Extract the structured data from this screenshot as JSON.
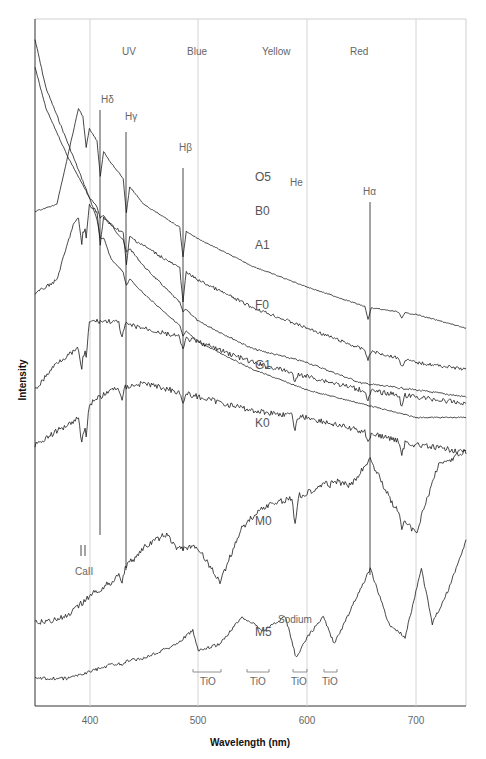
{
  "chart_data": {
    "type": "line",
    "title": "",
    "xlabel": "Wavelength (nm)",
    "ylabel": "Intensity",
    "xlim": [
      350,
      746
    ],
    "ylim": [
      0,
      1
    ],
    "grid": true,
    "x_ticks": [
      400,
      500,
      600,
      700
    ],
    "x_tick_labels": [
      "400",
      "500",
      "600",
      "700"
    ],
    "bands": [
      {
        "label": "UV",
        "x": 436
      },
      {
        "label": "Blue",
        "x": 530
      },
      {
        "label": "Yellow",
        "x": 630
      },
      {
        "label": "Red",
        "x": 736
      }
    ],
    "series": [
      {
        "name": "O5",
        "x": [
          350,
          360,
          380,
          400,
          420,
          450,
          500,
          550,
          600,
          650,
          700,
          746
        ],
        "values": [
          0.97,
          0.9,
          0.82,
          0.74,
          0.7,
          0.64,
          0.56,
          0.52,
          0.5,
          0.47,
          0.46,
          0.45
        ]
      },
      {
        "name": "B0",
        "x": [
          350,
          360,
          380,
          400,
          420,
          450,
          500,
          550,
          600,
          650,
          700,
          746
        ],
        "values": [
          0.93,
          0.87,
          0.8,
          0.74,
          0.65,
          0.6,
          0.53,
          0.49,
          0.46,
          0.44,
          0.42,
          0.42
        ]
      },
      {
        "name": "A1",
        "x": [
          350,
          370,
          380,
          390,
          400,
          420,
          450,
          500,
          550,
          600,
          656,
          700,
          746
        ],
        "values": [
          0.72,
          0.73,
          0.8,
          0.87,
          0.84,
          0.79,
          0.73,
          0.68,
          0.64,
          0.61,
          0.58,
          0.57,
          0.55
        ]
      },
      {
        "name": "F0",
        "x": [
          350,
          370,
          385,
          400,
          420,
          450,
          500,
          550,
          600,
          650,
          700,
          746
        ],
        "values": [
          0.6,
          0.62,
          0.7,
          0.73,
          0.7,
          0.67,
          0.62,
          0.58,
          0.55,
          0.52,
          0.5,
          0.49
        ]
      },
      {
        "name": "G1",
        "x": [
          350,
          370,
          390,
          400,
          420,
          450,
          500,
          550,
          600,
          650,
          700,
          746
        ],
        "values": [
          0.46,
          0.5,
          0.52,
          0.56,
          0.56,
          0.55,
          0.53,
          0.5,
          0.48,
          0.46,
          0.45,
          0.44
        ]
      },
      {
        "name": "K0",
        "x": [
          350,
          370,
          390,
          400,
          420,
          450,
          500,
          550,
          600,
          650,
          700,
          746
        ],
        "values": [
          0.38,
          0.4,
          0.42,
          0.44,
          0.46,
          0.47,
          0.45,
          0.43,
          0.42,
          0.4,
          0.38,
          0.37
        ]
      },
      {
        "name": "M0",
        "x": [
          350,
          380,
          400,
          420,
          450,
          470,
          480,
          500,
          520,
          540,
          560,
          580,
          600,
          620,
          640,
          658,
          680,
          700,
          720,
          746
        ],
        "values": [
          0.12,
          0.13,
          0.16,
          0.18,
          0.23,
          0.25,
          0.23,
          0.23,
          0.18,
          0.26,
          0.29,
          0.3,
          0.31,
          0.33,
          0.32,
          0.36,
          0.29,
          0.25,
          0.35,
          0.37
        ]
      },
      {
        "name": "M5",
        "x": [
          350,
          380,
          400,
          420,
          450,
          480,
          495,
          500,
          520,
          540,
          560,
          580,
          590,
          600,
          615,
          625,
          640,
          658,
          675,
          690,
          705,
          715,
          730,
          746
        ],
        "values": [
          0.04,
          0.04,
          0.05,
          0.06,
          0.07,
          0.09,
          0.11,
          0.08,
          0.09,
          0.13,
          0.11,
          0.13,
          0.07,
          0.1,
          0.13,
          0.09,
          0.14,
          0.2,
          0.12,
          0.1,
          0.2,
          0.12,
          0.17,
          0.24
        ]
      }
    ],
    "annotations": [
      {
        "text": "Hδ",
        "x": 410
      },
      {
        "text": "Hγ",
        "x": 434
      },
      {
        "text": "Hβ",
        "x": 486
      },
      {
        "text": "He",
        "x": 587
      },
      {
        "text": "Hα",
        "x": 656
      },
      {
        "text": "CaII",
        "x": 393
      },
      {
        "text": "Sodium",
        "x": 589
      },
      {
        "text": "TiO",
        "x": 506
      },
      {
        "text": "TiO",
        "x": 560
      },
      {
        "text": "TiO",
        "x": 590
      },
      {
        "text": "TiO",
        "x": 620
      }
    ]
  },
  "labels": {
    "xlabel": "Wavelength (nm)",
    "ylabel": "Intensity",
    "bands": [
      "UV",
      "Blue",
      "Yellow",
      "Red"
    ],
    "ticks": [
      "400",
      "500",
      "600",
      "700"
    ],
    "spectral_types": [
      "O5",
      "B0",
      "A1",
      "F0",
      "G1",
      "K0",
      "M0",
      "M5"
    ],
    "lines": {
      "h_delta": "Hδ",
      "h_gamma": "Hγ",
      "h_beta": "Hβ",
      "he": "He",
      "h_alpha": "Hα",
      "ca": "CaII",
      "sodium": "Sodium",
      "tio": "TiO"
    }
  }
}
